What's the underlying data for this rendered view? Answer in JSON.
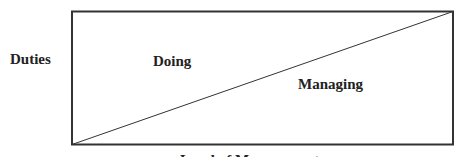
{
  "diagram": {
    "y_axis_label": "Duties",
    "regions": [
      {
        "label": "Doing",
        "position": "upper-left triangle"
      },
      {
        "label": "Managing",
        "position": "lower-right triangle"
      }
    ],
    "x_axis_label": "Level of Management",
    "divider": "diagonal line from bottom-left to top-right",
    "colors": {
      "stroke": "#333333",
      "background": "#ffffff"
    }
  }
}
